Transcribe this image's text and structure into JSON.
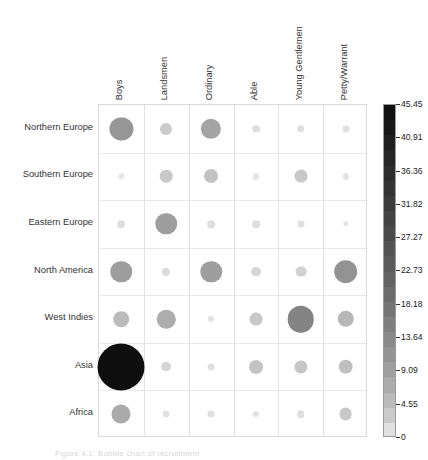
{
  "chart_data": {
    "type": "heatmap",
    "title": "",
    "subtitle": "",
    "xlabel": "",
    "ylabel": "",
    "categories": [
      "Boys",
      "Landsmen",
      "Ordinary",
      "Able",
      "Young Gentlemen",
      "Petty/Warrant"
    ],
    "rows": [
      "Northern Europe",
      "Southern Europe",
      "Eastern Europe",
      "North America",
      "West Indies",
      "Asia",
      "Africa"
    ],
    "grid": true,
    "legend_position": "right",
    "encoding": "bubble size and grayscale both encode the same value",
    "colorbar": {
      "min": 0,
      "max": 45.45,
      "tick_labels": [
        "45.45",
        "40.91",
        "36.36",
        "31.82",
        "27.27",
        "22.73",
        "18.18",
        "13.64",
        "9.09",
        "4.55",
        "0"
      ],
      "tick_values": [
        45.45,
        40.91,
        36.36,
        31.82,
        27.27,
        22.73,
        18.18,
        13.64,
        9.09,
        4.55,
        0
      ],
      "colormap": "grayscale (white = 0, black = 45.45)",
      "discrete_segments": 22
    },
    "series": [
      {
        "name": "Northern Europe",
        "values": [
          11.0,
          3.0,
          8.5,
          1.2,
          1.2,
          1.0
        ]
      },
      {
        "name": "Southern Europe",
        "values": [
          0.6,
          3.2,
          4.0,
          0.8,
          3.4,
          0.8
        ]
      },
      {
        "name": "Eastern Europe",
        "values": [
          1.2,
          9.5,
          1.2,
          1.2,
          1.0,
          0.6
        ]
      },
      {
        "name": "North America",
        "values": [
          9.5,
          1.4,
          9.5,
          2.0,
          2.4,
          11.5
        ]
      },
      {
        "name": "West Indies",
        "values": [
          5.0,
          7.0,
          0.8,
          3.4,
          14.5,
          5.5
        ]
      },
      {
        "name": "Asia",
        "values": [
          45.45,
          2.0,
          1.0,
          4.0,
          3.6,
          4.4
        ]
      },
      {
        "name": "Africa",
        "values": [
          7.5,
          1.0,
          1.0,
          0.8,
          1.2,
          3.4
        ]
      }
    ]
  },
  "caption": {
    "text": "Figure 4.1: Bubble chart of recruitment"
  },
  "colors": {
    "background": "#ffffff",
    "grid_line": "#e2e2e2",
    "axis_line": "#d9d9d9",
    "text": "#333333",
    "bubble_max": "#101010",
    "bubble_min": "#f2f2f2"
  }
}
